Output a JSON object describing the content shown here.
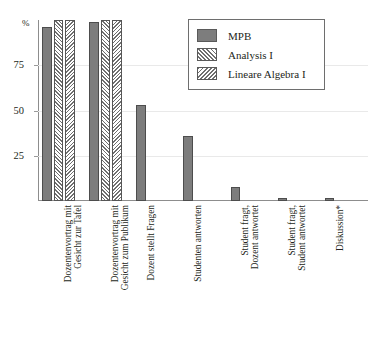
{
  "chart_data": {
    "type": "bar",
    "title": "",
    "subtitle": "",
    "xlabel": "",
    "ylabel": "%",
    "ylim": [
      0,
      100
    ],
    "grid": true,
    "legend_position": "top-right",
    "ytick_labels": [
      "75",
      "50",
      "25"
    ],
    "ytick_values": [
      75,
      50,
      25
    ],
    "categories": [
      "Dozentenvortrag mit\nGesicht zur Tafel",
      "Dozentenvortrag mit\nGesicht zum Publikum",
      "Dozent stellt Fragen",
      "Studenten antworten",
      "Student fragt,\nDozent antwortet",
      "Student fragt,\nStudent antwortet",
      "Diskussion*"
    ],
    "series": [
      {
        "name": "MPB",
        "pattern": "solid",
        "color": "#7d7d7d",
        "values": [
          96,
          99,
          53,
          36,
          8,
          1.5,
          1.5
        ]
      },
      {
        "name": "Analysis I",
        "pattern": "hatch-forward",
        "color": "#6f6f6f",
        "values": [
          100,
          100,
          null,
          null,
          null,
          null,
          null
        ]
      },
      {
        "name": "Lineare Algebra I",
        "pattern": "hatch-backward",
        "color": "#6f6f6f",
        "values": [
          100,
          100,
          null,
          null,
          null,
          null,
          null
        ]
      }
    ]
  },
  "legend": {
    "entries": [
      {
        "label": "MPB"
      },
      {
        "label": "Analysis I"
      },
      {
        "label": "Lineare Algebra I"
      }
    ]
  }
}
